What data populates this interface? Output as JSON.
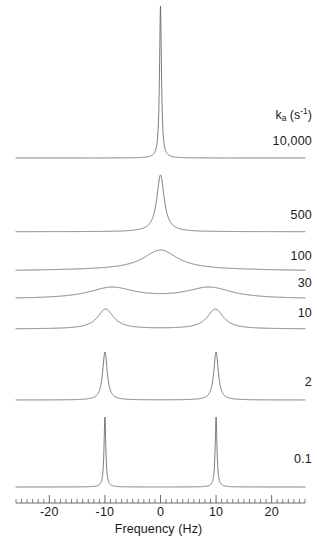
{
  "figure": {
    "axis_title": "Frequency (Hz)",
    "rate_header_symbol": "k",
    "rate_header_subscript": "a",
    "rate_header_units_open": "(s",
    "rate_header_units_exp": "-1",
    "rate_header_units_close": ")",
    "line_color": "#5a5a5a",
    "background_color": "#ffffff",
    "text_color": "#1a1a1a"
  },
  "axis": {
    "tick_labels": [
      "-20",
      "-10",
      "0",
      "10",
      "20"
    ],
    "tick_values": [
      -20,
      -10,
      0,
      10,
      20
    ],
    "minor_tick_step": 1,
    "range_min": -26,
    "range_max": 26
  },
  "traces": [
    {
      "label": "10,000",
      "rate": 10000,
      "baseline_y": 158,
      "height": 152,
      "label_y": 134
    },
    {
      "label": "500",
      "rate": 500,
      "baseline_y": 232,
      "height": 57,
      "label_y": 208
    },
    {
      "label": "100",
      "rate": 100,
      "baseline_y": 272,
      "height": 22,
      "label_y": 249
    },
    {
      "label": "30",
      "rate": 30,
      "baseline_y": 299,
      "height": 12,
      "label_y": 276
    },
    {
      "label": "10",
      "rate": 10,
      "baseline_y": 329,
      "height": 20,
      "label_y": 306
    },
    {
      "label": "2",
      "rate": 2,
      "baseline_y": 400,
      "height": 48,
      "label_y": 375
    },
    {
      "label": "0.1",
      "rate": 0.1,
      "baseline_y": 487,
      "height": 70,
      "label_y": 452
    }
  ],
  "chart_data": {
    "type": "line",
    "title": "",
    "xlabel": "Frequency (Hz)",
    "ylabel": "",
    "xlim": [
      -26,
      26
    ],
    "xticks": [
      -20,
      -10,
      0,
      10,
      20
    ],
    "grid": false,
    "legend_position": "right",
    "site_frequencies_hz": [
      -10,
      10
    ],
    "site_populations": [
      0.5,
      0.5
    ],
    "intrinsic_linewidth_hz": 0.35,
    "series": [
      {
        "name": "10,000",
        "rate_s-1": 10000,
        "regime": "fast exchange",
        "peaks_hz": [
          0
        ],
        "relative_peak_height": 1.0
      },
      {
        "name": "500",
        "rate_s-1": 500,
        "regime": "fast exchange",
        "peaks_hz": [
          0
        ],
        "relative_peak_height": 0.375
      },
      {
        "name": "100",
        "rate_s-1": 100,
        "regime": "near coalescence",
        "peaks_hz": [
          0
        ],
        "relative_peak_height": 0.145
      },
      {
        "name": "30",
        "rate_s-1": 30,
        "regime": "coalescence",
        "peaks_hz": [
          0
        ],
        "relative_peak_height": 0.079
      },
      {
        "name": "10",
        "rate_s-1": 10,
        "regime": "slow-intermediate exchange",
        "peaks_hz": [
          -10,
          10
        ],
        "relative_peak_height": 0.132
      },
      {
        "name": "2",
        "rate_s-1": 2,
        "regime": "slow exchange",
        "peaks_hz": [
          -10,
          10
        ],
        "relative_peak_height": 0.316
      },
      {
        "name": "0.1",
        "rate_s-1": 0.1,
        "regime": "slow exchange",
        "peaks_hz": [
          -10,
          10
        ],
        "relative_peak_height": 0.461
      }
    ]
  }
}
